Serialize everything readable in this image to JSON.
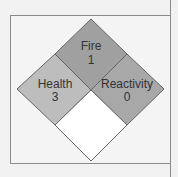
{
  "diagram": {
    "type": "nfpa-704-hazard-diamond",
    "quadrants": {
      "fire": {
        "label": "Fire",
        "value": "1",
        "color": "#a0a0a0"
      },
      "health": {
        "label": "Health",
        "value": "3",
        "color": "#bdbdbd"
      },
      "reactivity": {
        "label": "Reactivity",
        "value": "0",
        "color": "#a8a8a8"
      },
      "special": {
        "label": "",
        "value": "",
        "color": "#ffffff"
      }
    }
  }
}
